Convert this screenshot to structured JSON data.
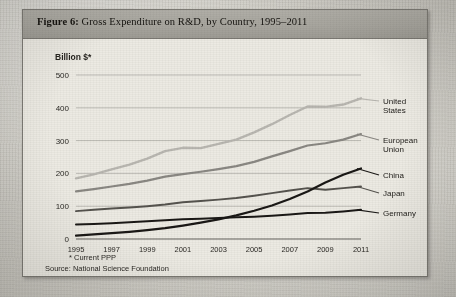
{
  "figure": {
    "label": "Figure 6:",
    "title": "Gross Expenditure on R&D, by Country, 1995–2011"
  },
  "axis_unit_label": "Billion $*",
  "footnotes": {
    "ppp_note": "* Current PPP",
    "source": "Source: National Science Foundation"
  },
  "series_labels": {
    "united_states_line1": "United",
    "united_states_line2": "States",
    "european_union_line1": "European",
    "european_union_line2": "Union",
    "china": "China",
    "japan": "Japan",
    "germany": "Germany"
  },
  "colors": {
    "united_states": "#b9b7b1",
    "european_union": "#8a8883",
    "japan": "#55534e",
    "china": "#1a1816",
    "germany": "#1a1816",
    "grid": "#a9a7a0",
    "axis": "#55534e",
    "header_band": "#a6a49d",
    "panel": "#eceae3"
  },
  "chart_data": {
    "type": "line",
    "title": "Gross Expenditure on R&D, by Country, 1995–2011",
    "xlabel": "",
    "ylabel": "Billion $*",
    "ylim": [
      0,
      500
    ],
    "yticks": [
      0,
      100,
      200,
      300,
      400,
      500
    ],
    "xlim": [
      1995,
      2011
    ],
    "xticks": [
      1995,
      1997,
      1999,
      2001,
      2003,
      2005,
      2007,
      2009,
      2011
    ],
    "xtick_labels": [
      "1995",
      "1997",
      "1999",
      "2001",
      "2003",
      "2005",
      "2007",
      "2009",
      "2011"
    ],
    "ytick_labels": [
      "0",
      "100",
      "200",
      "300",
      "400",
      "500"
    ],
    "grid": true,
    "legend_position": "right-inline-labels",
    "x": [
      1995,
      1996,
      1997,
      1998,
      1999,
      2000,
      2001,
      2002,
      2003,
      2004,
      2005,
      2006,
      2007,
      2008,
      2009,
      2010,
      2011
    ],
    "series": [
      {
        "name": "United States",
        "color": "#b9b7b1",
        "values": [
          185,
          197,
          212,
          227,
          245,
          268,
          278,
          277,
          290,
          303,
          325,
          350,
          378,
          404,
          403,
          410,
          429
        ]
      },
      {
        "name": "European Union",
        "color": "#8a8883",
        "values": [
          145,
          152,
          160,
          168,
          178,
          190,
          198,
          205,
          213,
          222,
          235,
          252,
          268,
          285,
          292,
          303,
          320
        ]
      },
      {
        "name": "Japan",
        "color": "#55534e",
        "values": [
          85,
          89,
          93,
          96,
          100,
          105,
          112,
          116,
          120,
          125,
          132,
          140,
          148,
          155,
          150,
          155,
          160
        ]
      },
      {
        "name": "China",
        "color": "#1a1816",
        "values": [
          10,
          14,
          18,
          22,
          27,
          33,
          41,
          50,
          60,
          72,
          86,
          102,
          122,
          145,
          172,
          196,
          215
        ]
      },
      {
        "name": "Germany",
        "color": "#1a1816",
        "values": [
          44,
          46,
          48,
          51,
          54,
          57,
          60,
          62,
          64,
          66,
          68,
          71,
          75,
          79,
          80,
          84,
          89
        ]
      }
    ],
    "annotations": [
      "China overtakes Japan between 2008 and 2009",
      "United States plateaus 2008–2009"
    ]
  }
}
